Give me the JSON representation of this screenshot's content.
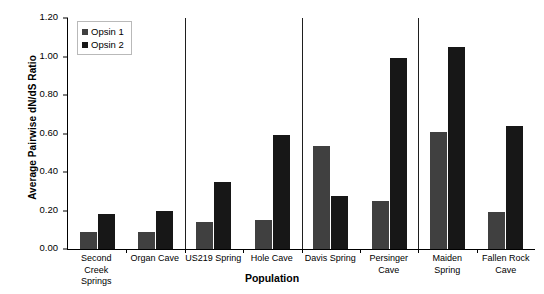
{
  "chart_data": {
    "type": "bar",
    "title": "",
    "xlabel": "Population",
    "ylabel": "Average Pairwise dN/dS Ratio",
    "ylim": [
      0.0,
      1.2
    ],
    "ytick_labels": [
      "0.00",
      "0.20",
      "0.40",
      "0.60",
      "0.80",
      "1.00",
      "1.20"
    ],
    "ytick_values": [
      0.0,
      0.2,
      0.4,
      0.6,
      0.8,
      1.0,
      1.2
    ],
    "grid": false,
    "legend_position": "top-left-inside",
    "categories": [
      "Second Creek Springs",
      "Organ Cave",
      "US219 Spring",
      "Hole Cave",
      "Davis Spring",
      "Persinger Cave",
      "Maiden Spring",
      "Fallen Rock Cave"
    ],
    "series": [
      {
        "name": "Opsin 1",
        "color": "#404040",
        "values": [
          0.09,
          0.09,
          0.14,
          0.15,
          0.535,
          0.25,
          0.61,
          0.19
        ]
      },
      {
        "name": "Opsin 2",
        "color": "#171717",
        "values": [
          0.18,
          0.2,
          0.35,
          0.59,
          0.275,
          0.99,
          1.05,
          0.64
        ]
      }
    ],
    "group_separators_after": [
      1,
      3,
      5
    ]
  }
}
